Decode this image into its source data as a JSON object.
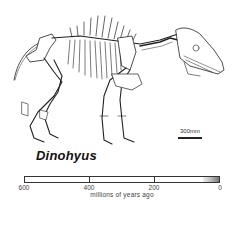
{
  "figure": {
    "species_name": "Dinohyus",
    "scale_bar": {
      "label": "300mm"
    },
    "timeline": {
      "axis_title": "millions of years ago",
      "ticks": [
        {
          "label": "600",
          "pos": 0
        },
        {
          "label": "400",
          "pos": 65
        },
        {
          "label": "200",
          "pos": 130
        },
        {
          "label": "0",
          "pos": 196
        }
      ],
      "highlight_range_mya": [
        0,
        50
      ]
    },
    "colors": {
      "line": "#222222",
      "text": "#111111",
      "background": "#ffffff",
      "shade": "#777777"
    }
  }
}
